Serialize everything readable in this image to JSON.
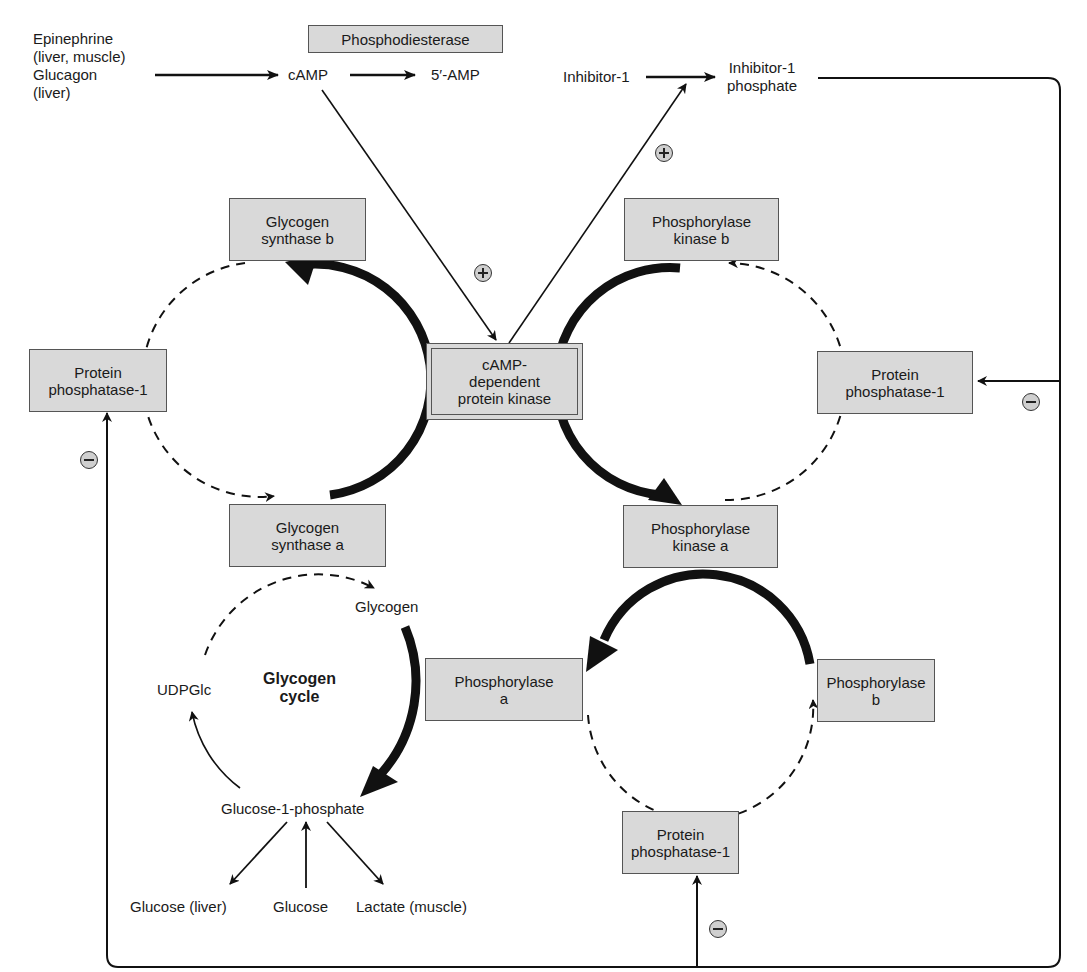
{
  "diagram": {
    "title_center": "Glycogen cycle",
    "inputs": {
      "hormones": [
        "Epinephrine",
        "(liver, muscle)",
        "Glucagon",
        "(liver)"
      ],
      "camp": "cAMP",
      "amp": "5′-AMP",
      "phosphodiesterase": "Phosphodiesterase",
      "inhibitor1": "Inhibitor-1",
      "inhibitor1_phosphate": [
        "Inhibitor-1",
        "phosphate"
      ]
    },
    "enzymes": {
      "glycogen_synthase_b": [
        "Glycogen",
        "synthase b"
      ],
      "glycogen_synthase_a": [
        "Glycogen",
        "synthase a"
      ],
      "camp_pk": [
        "cAMP-",
        "dependent",
        "protein kinase"
      ],
      "phosphorylase_kinase_b": [
        "Phosphorylase",
        "kinase b"
      ],
      "phosphorylase_kinase_a": [
        "Phosphorylase",
        "kinase a"
      ],
      "phosphorylase_a": [
        "Phosphorylase",
        "a"
      ],
      "phosphorylase_b": [
        "Phosphorylase",
        "b"
      ],
      "pp1_left": [
        "Protein",
        "phosphatase-1"
      ],
      "pp1_right": [
        "Protein",
        "phosphatase-1"
      ],
      "pp1_bottom": [
        "Protein",
        "phosphatase-1"
      ]
    },
    "metabolites": {
      "glycogen": "Glycogen",
      "udpglc": "UDPGlc",
      "g1p": "Glucose-1-phosphate",
      "glucose_liver": "Glucose (liver)",
      "glucose": "Glucose",
      "lactate": "Lactate (muscle)"
    },
    "cycle_label": [
      "Glycogen",
      "cycle"
    ],
    "signs": {
      "plus": "+",
      "minus": "−"
    },
    "colors": {
      "box_fill": "#d9d9d9",
      "box_border": "#555555",
      "line": "#111111",
      "sign_fill": "#cfcfcf"
    }
  }
}
